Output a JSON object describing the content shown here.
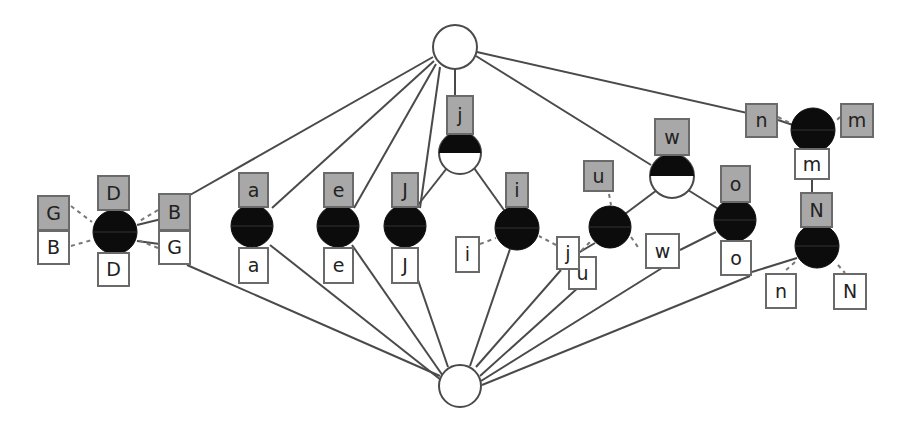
{
  "diagram": {
    "colors": {
      "edge": "#4a4a4a",
      "node_fill_dark": "#0c0c0c",
      "node_fill_light": "#ffffff",
      "label_gray": "#a8a8a8",
      "label_white": "#ffffff",
      "border": "#6a6a6a"
    },
    "root_top": {
      "x": 455,
      "y": 47,
      "r": 22
    },
    "root_bottom": {
      "x": 460,
      "y": 386,
      "r": 21
    },
    "nodes": [
      {
        "id": "D",
        "x": 115,
        "y": 232,
        "r": 22,
        "style": "full"
      },
      {
        "id": "a",
        "x": 252,
        "y": 226,
        "r": 21,
        "style": "full"
      },
      {
        "id": "e",
        "x": 338,
        "y": 226,
        "r": 21,
        "style": "full"
      },
      {
        "id": "J",
        "x": 405,
        "y": 226,
        "r": 21,
        "style": "full"
      },
      {
        "id": "j",
        "x": 460,
        "y": 153,
        "r": 21,
        "style": "half"
      },
      {
        "id": "i",
        "x": 517,
        "y": 228,
        "r": 22,
        "style": "full"
      },
      {
        "id": "u",
        "x": 610,
        "y": 227,
        "r": 21,
        "style": "full"
      },
      {
        "id": "w",
        "x": 672,
        "y": 176,
        "r": 22,
        "style": "half"
      },
      {
        "id": "o",
        "x": 735,
        "y": 220,
        "r": 21,
        "style": "full"
      },
      {
        "id": "m",
        "x": 813,
        "y": 130,
        "r": 22,
        "style": "full"
      },
      {
        "id": "N",
        "x": 817,
        "y": 246,
        "r": 22,
        "style": "full"
      }
    ],
    "labels": [
      {
        "text": "G",
        "x": 37,
        "y": 195,
        "w": 33,
        "h": 36,
        "kind": "gray"
      },
      {
        "text": "B",
        "x": 37,
        "y": 230,
        "w": 33,
        "h": 35,
        "kind": "white"
      },
      {
        "text": "D",
        "x": 97,
        "y": 175,
        "w": 33,
        "h": 36,
        "kind": "gray"
      },
      {
        "text": "D",
        "x": 97,
        "y": 252,
        "w": 33,
        "h": 35,
        "kind": "white"
      },
      {
        "text": "B",
        "x": 158,
        "y": 193,
        "w": 33,
        "h": 38,
        "kind": "gray"
      },
      {
        "text": "G",
        "x": 158,
        "y": 230,
        "w": 33,
        "h": 35,
        "kind": "white"
      },
      {
        "text": "a",
        "x": 238,
        "y": 172,
        "w": 31,
        "h": 36,
        "kind": "gray"
      },
      {
        "text": "a",
        "x": 238,
        "y": 247,
        "w": 31,
        "h": 37,
        "kind": "white"
      },
      {
        "text": "e",
        "x": 323,
        "y": 172,
        "w": 31,
        "h": 36,
        "kind": "gray"
      },
      {
        "text": "e",
        "x": 323,
        "y": 247,
        "w": 31,
        "h": 37,
        "kind": "white"
      },
      {
        "text": "J",
        "x": 391,
        "y": 172,
        "w": 28,
        "h": 36,
        "kind": "gray"
      },
      {
        "text": "J",
        "x": 391,
        "y": 247,
        "w": 28,
        "h": 37,
        "kind": "white"
      },
      {
        "text": "j",
        "x": 446,
        "y": 95,
        "w": 28,
        "h": 40,
        "kind": "gray"
      },
      {
        "text": "i",
        "x": 505,
        "y": 172,
        "w": 24,
        "h": 36,
        "kind": "gray"
      },
      {
        "text": "i",
        "x": 455,
        "y": 236,
        "w": 25,
        "h": 37,
        "kind": "white"
      },
      {
        "text": "u",
        "x": 568,
        "y": 256,
        "w": 29,
        "h": 34,
        "kind": "white"
      },
      {
        "text": "j",
        "x": 556,
        "y": 236,
        "w": 24,
        "h": 34,
        "kind": "white"
      },
      {
        "text": "u",
        "x": 583,
        "y": 160,
        "w": 31,
        "h": 32,
        "kind": "gray"
      },
      {
        "text": "w",
        "x": 654,
        "y": 118,
        "w": 36,
        "h": 38,
        "kind": "gray"
      },
      {
        "text": "w",
        "x": 645,
        "y": 233,
        "w": 35,
        "h": 36,
        "kind": "white"
      },
      {
        "text": "o",
        "x": 720,
        "y": 165,
        "w": 31,
        "h": 38,
        "kind": "gray"
      },
      {
        "text": "o",
        "x": 720,
        "y": 240,
        "w": 32,
        "h": 36,
        "kind": "white"
      },
      {
        "text": "n",
        "x": 745,
        "y": 103,
        "w": 33,
        "h": 35,
        "kind": "gray"
      },
      {
        "text": "m",
        "x": 840,
        "y": 103,
        "w": 34,
        "h": 35,
        "kind": "gray"
      },
      {
        "text": "m",
        "x": 794,
        "y": 148,
        "w": 36,
        "h": 32,
        "kind": "white"
      },
      {
        "text": "N",
        "x": 800,
        "y": 192,
        "w": 33,
        "h": 36,
        "kind": "gray"
      },
      {
        "text": "n",
        "x": 765,
        "y": 273,
        "w": 32,
        "h": 36,
        "kind": "white"
      },
      {
        "text": "N",
        "x": 833,
        "y": 273,
        "w": 34,
        "h": 37,
        "kind": "white"
      }
    ],
    "edges": [
      [
        433,
        57,
        190,
        195
      ],
      [
        434,
        61,
        272,
        208
      ],
      [
        436,
        64,
        354,
        208
      ],
      [
        440,
        67,
        420,
        208
      ],
      [
        455,
        69,
        455,
        95
      ],
      [
        476,
        56,
        651,
        165
      ],
      [
        477,
        52,
        778,
        120
      ],
      [
        778,
        120,
        793,
        125
      ],
      [
        187,
        265,
        440,
        376
      ],
      [
        270,
        245,
        441,
        380
      ],
      [
        352,
        245,
        443,
        376
      ],
      [
        418,
        280,
        448,
        367
      ],
      [
        510,
        249,
        470,
        366
      ],
      [
        561,
        270,
        476,
        367
      ],
      [
        580,
        286,
        480,
        376
      ],
      [
        595,
        243,
        573,
        256
      ],
      [
        662,
        268,
        481,
        381
      ],
      [
        750,
        276,
        482,
        385
      ],
      [
        797,
        258,
        752,
        272
      ],
      [
        190,
        212,
        137,
        225
      ],
      [
        190,
        248,
        137,
        241
      ],
      [
        447,
        168,
        414,
        210
      ],
      [
        474,
        168,
        504,
        210
      ],
      [
        657,
        190,
        625,
        214
      ],
      [
        688,
        190,
        720,
        210
      ],
      [
        680,
        250,
        716,
        232
      ],
      [
        812,
        180,
        812,
        192
      ]
    ],
    "dashes": [
      [
        71,
        206,
        92,
        222
      ],
      [
        71,
        246,
        92,
        240
      ],
      [
        158,
        210,
        138,
        222
      ],
      [
        158,
        248,
        138,
        240
      ],
      [
        480,
        244,
        496,
        238
      ],
      [
        556,
        245,
        539,
        236
      ],
      [
        570,
        262,
        590,
        242
      ],
      [
        609,
        194,
        611,
        205
      ],
      [
        631,
        237,
        640,
        250
      ],
      [
        778,
        117,
        792,
        124
      ],
      [
        840,
        117,
        833,
        124
      ],
      [
        795,
        262,
        784,
        272
      ],
      [
        838,
        265,
        845,
        273
      ]
    ]
  }
}
